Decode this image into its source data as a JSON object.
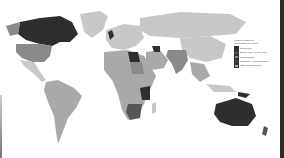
{
  "map": {
    "subject": "World map of countries historically associated with Great Britain",
    "colors": {
      "ocean": "#ffffff",
      "land_other": "#c8c8c8",
      "land_light": "#a9a9a9",
      "land_mid": "#8a8a8a",
      "land_dark": "#555555",
      "land_darkest": "#2e2e2e"
    },
    "regions": [
      {
        "name": "Canada",
        "shade": "land_darkest"
      },
      {
        "name": "United States",
        "shade": "land_mid"
      },
      {
        "name": "Greenland",
        "shade": "land_other"
      },
      {
        "name": "Mexico & Central America",
        "shade": "land_other"
      },
      {
        "name": "South America",
        "shade": "land_light"
      },
      {
        "name": "Europe",
        "shade": "land_other"
      },
      {
        "name": "Russia & Northern Asia",
        "shade": "land_other"
      },
      {
        "name": "United Kingdom",
        "shade": "land_darkest"
      },
      {
        "name": "North Africa",
        "shade": "land_light"
      },
      {
        "name": "Egypt",
        "shade": "land_darkest"
      },
      {
        "name": "Sudan",
        "shade": "land_mid"
      },
      {
        "name": "East Africa",
        "shade": "land_mid"
      },
      {
        "name": "Kenya / Uganda",
        "shade": "land_darkest"
      },
      {
        "name": "Southern Africa",
        "shade": "land_dark"
      },
      {
        "name": "Arabian Peninsula",
        "shade": "land_light"
      },
      {
        "name": "Iraq",
        "shade": "land_darkest"
      },
      {
        "name": "India & South Asia",
        "shade": "land_mid"
      },
      {
        "name": "China & East Asia",
        "shade": "land_other"
      },
      {
        "name": "Southeast Asia",
        "shade": "land_light"
      },
      {
        "name": "Papua New Guinea",
        "shade": "land_darkest"
      },
      {
        "name": "Australia",
        "shade": "land_darkest"
      },
      {
        "name": "New Zealand",
        "shade": "land_dark"
      }
    ]
  },
  "legend": {
    "title_line1": "United Kingdom of",
    "title_line2": "Great Britain & Ireland",
    "items": [
      {
        "label": "Dominions",
        "color": "#2e2e2e"
      },
      {
        "label": "British India, Ruled Areas",
        "color": "#555555"
      },
      {
        "label": "Protectorates",
        "color": "#8a8a8a"
      },
      {
        "label": "Mandates, Trust Territories",
        "color": "#444444"
      },
      {
        "label": "Other dependencies",
        "color": "#a9a9a9"
      }
    ]
  }
}
